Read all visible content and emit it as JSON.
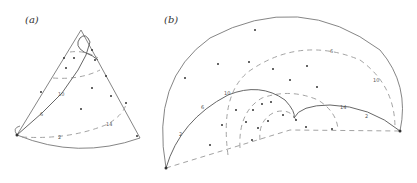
{
  "figure": {
    "panels": [
      {
        "id": "a",
        "label": "(a)",
        "description": "Cone surface with dashed circles and a spiral geodesic trace",
        "markers": [
          "2",
          "6",
          "10",
          "14"
        ]
      },
      {
        "id": "b",
        "label": "(b)",
        "description": "Unrolled cone (circular sector) with dashed arcs and spiral trace",
        "markers": [
          "2",
          "6",
          "10",
          "14",
          "2",
          "6",
          "10"
        ]
      }
    ]
  }
}
